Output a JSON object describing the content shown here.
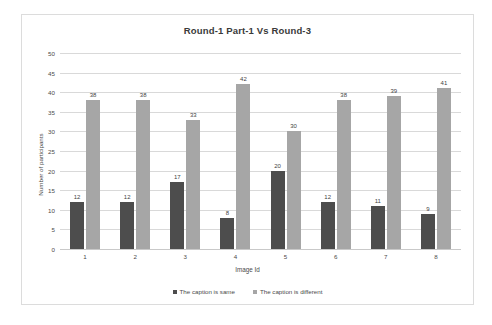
{
  "chart_data": {
    "type": "bar",
    "title": "Round-1 Part-1 Vs Round-3",
    "xlabel": "Image Id",
    "ylabel": "Number of participants",
    "categories": [
      "1",
      "2",
      "3",
      "4",
      "5",
      "6",
      "7",
      "8"
    ],
    "series": [
      {
        "name": "The caption is same",
        "color": "#4d4d4d",
        "values": [
          12,
          12,
          17,
          8,
          20,
          12,
          11,
          9
        ]
      },
      {
        "name": "The caption is different",
        "color": "#a6a6a6",
        "values": [
          38,
          38,
          33,
          42,
          30,
          38,
          39,
          41
        ]
      }
    ],
    "ylim": [
      0,
      50
    ],
    "ytick_labels": [
      "50",
      "45",
      "40",
      "35",
      "30",
      "25",
      "20",
      "15",
      "10",
      "5",
      "0"
    ],
    "ytick_values": [
      50,
      45,
      40,
      35,
      30,
      25,
      20,
      15,
      10,
      5,
      0
    ],
    "grid": true,
    "legend_position": "bottom",
    "data_labels": true
  },
  "colors": {
    "series_same": "#4d4d4d",
    "series_different": "#a6a6a6",
    "gridline": "#d9d9d9",
    "frame_border": "#dcdcdc",
    "text": "#4a4a4a",
    "background": "#ffffff"
  }
}
